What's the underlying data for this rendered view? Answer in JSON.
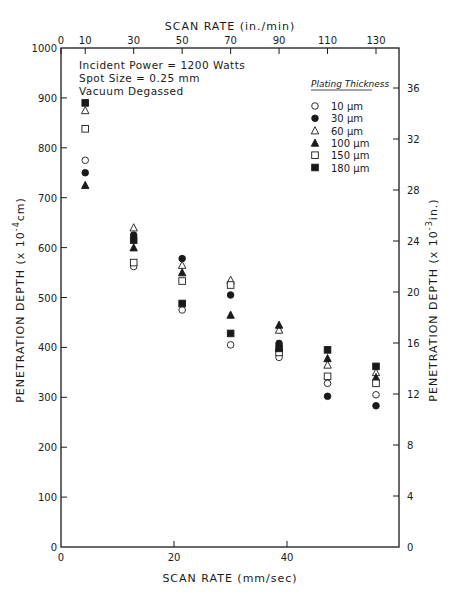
{
  "chart_data": {
    "type": "scatter",
    "title": "",
    "xlabel_bottom": "SCAN RATE  (mm/sec)",
    "xlabel_top": "SCAN RATE  (in./min)",
    "ylabel_left": "PENETRATION DEPTH  (x 10⁻⁴ cm)",
    "ylabel_right": "PENETRATION DEPTH  (x 10⁻³ in.)",
    "x_top_ticks": [
      0,
      10,
      30,
      50,
      70,
      90,
      110,
      130
    ],
    "x_bottom_ticks": [
      0,
      20,
      40
    ],
    "y_left_ticks": [
      0,
      100,
      200,
      300,
      400,
      500,
      600,
      700,
      800,
      900,
      1000
    ],
    "y_right_ticks": [
      0,
      4,
      8,
      12,
      16,
      20,
      24,
      28,
      32,
      36
    ],
    "xlim_in_per_min": [
      0,
      139
    ],
    "xlim_mm_per_sec": [
      0,
      59
    ],
    "ylim": [
      0,
      1000
    ],
    "grid": false,
    "legend_position": "upper right",
    "annotations": [
      "Incident Power = 1200 Watts",
      "Spot Size = 0.25 mm",
      "Vacuum Degassed"
    ],
    "legend_title": "Plating Thickness",
    "x": [
      10,
      30,
      50,
      70,
      90,
      110,
      130
    ],
    "series": [
      {
        "name": "10 μm",
        "marker": "open-circle",
        "values": [
          775,
          562,
          475,
          405,
          380,
          328,
          305
        ]
      },
      {
        "name": "30 μm",
        "marker": "filled-circle",
        "values": [
          750,
          625,
          578,
          505,
          408,
          302,
          283
        ]
      },
      {
        "name": "60 μm",
        "marker": "open-triangle",
        "values": [
          875,
          640,
          565,
          535,
          435,
          365,
          350
        ]
      },
      {
        "name": "100 μm",
        "marker": "filled-triangle",
        "values": [
          725,
          600,
          550,
          465,
          445,
          378,
          340
        ]
      },
      {
        "name": "150 μm",
        "marker": "open-square",
        "values": [
          838,
          570,
          533,
          525,
          390,
          342,
          328
        ]
      },
      {
        "name": "180 μm",
        "marker": "filled-square",
        "values": [
          890,
          615,
          488,
          428,
          398,
          395,
          362
        ]
      }
    ]
  },
  "labels": {
    "top_axis_title": "SCAN RATE   (in./min)",
    "bottom_axis_title": "SCAN RATE   (mm/sec)",
    "left_axis_title": "PENETRATION DEPTH  (x 10",
    "left_axis_exp": "-4",
    "left_axis_unit": "cm)",
    "right_axis_title": "PENETRATION DEPTH  (x 10",
    "right_axis_exp": "-3",
    "right_axis_unit": "in.)",
    "annot_1": "Incident Power = 1200 Watts",
    "annot_2": "Spot Size = 0.25 mm",
    "annot_3": "Vacuum Degassed",
    "legend_title": "Plating Thickness",
    "legend_items": [
      "10 μm",
      "30 μm",
      "60 μm",
      "100 μm",
      "150 μm",
      "180 μm"
    ]
  },
  "style": {
    "ink": "#1a1a1a",
    "background": "#ffffff"
  }
}
